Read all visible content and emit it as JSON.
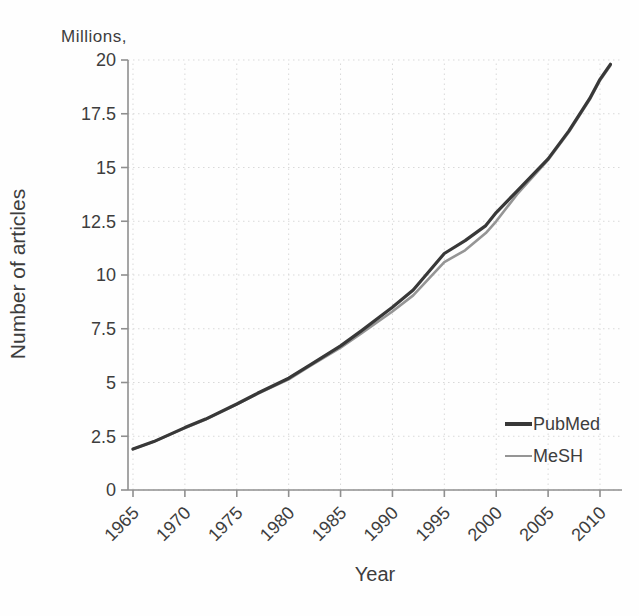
{
  "chart_data": {
    "type": "line",
    "unit_label": "Millions,",
    "ylabel": "Number of articles",
    "xlabel": "Year",
    "grid": true,
    "grid_style": "dotted",
    "grid_color": "#d9d9d9",
    "axis_color": "#8f8f8f",
    "text_color": "#3d3d3d",
    "legend_position": "lower-right",
    "xlim": [
      1965,
      2011.5
    ],
    "ylim": [
      0,
      20
    ],
    "x_ticks": [
      1965,
      1970,
      1975,
      1980,
      1985,
      1990,
      1995,
      2000,
      2005,
      2010
    ],
    "y_ticks": [
      0,
      2.5,
      5,
      7.5,
      10,
      12.5,
      15,
      17.5,
      20
    ],
    "series": [
      {
        "name": "PubMed",
        "color": "#383838",
        "line_width": 3.2,
        "x": [
          1965,
          1967,
          1970,
          1972,
          1975,
          1977,
          1980,
          1982,
          1985,
          1987,
          1990,
          1992,
          1995,
          1997,
          1999,
          2000,
          2002,
          2005,
          2007,
          2009,
          2010,
          2011
        ],
        "y": [
          1.9,
          2.25,
          2.9,
          3.3,
          4.0,
          4.5,
          5.2,
          5.8,
          6.7,
          7.4,
          8.5,
          9.3,
          11.0,
          11.6,
          12.3,
          12.9,
          13.9,
          15.4,
          16.7,
          18.2,
          19.1,
          19.8
        ]
      },
      {
        "name": "MeSH",
        "color": "#959595",
        "line_width": 2.6,
        "x": [
          1965,
          1967,
          1970,
          1972,
          1975,
          1977,
          1980,
          1982,
          1985,
          1987,
          1990,
          1992,
          1995,
          1997,
          1999,
          2000,
          2002,
          2005,
          2007,
          2009,
          2010,
          2011
        ],
        "y": [
          1.9,
          2.25,
          2.88,
          3.28,
          3.98,
          4.47,
          5.15,
          5.75,
          6.62,
          7.28,
          8.3,
          9.05,
          10.6,
          11.15,
          11.95,
          12.5,
          13.75,
          15.35,
          16.65,
          18.15,
          19.05,
          19.75
        ]
      }
    ]
  }
}
